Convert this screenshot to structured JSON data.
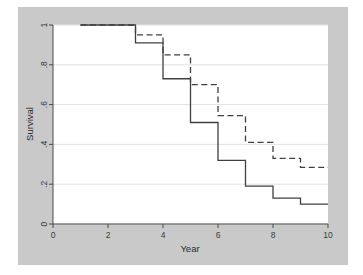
{
  "figure": {
    "panel_bg": "#c9c9c9",
    "plot_bg": "#ffffff",
    "grid_color": "#e2e2e2",
    "axis_color": "#4a4a4a"
  },
  "chart_data": {
    "type": "line",
    "title": "",
    "xlabel": "Year",
    "ylabel": "Survival",
    "xlim": [
      0,
      10
    ],
    "ylim": [
      0,
      1
    ],
    "xticks": [
      0,
      2,
      4,
      6,
      8,
      10
    ],
    "xtick_labels": [
      "0",
      "2",
      "4",
      "6",
      "8",
      "10"
    ],
    "yticks": [
      0,
      0.2,
      0.4,
      0.6,
      0.8,
      1
    ],
    "ytick_labels": [
      "0",
      ".2",
      ".4",
      ".6",
      ".8",
      "1"
    ],
    "grid": "horizontal",
    "legend": "none",
    "step_type": "post",
    "series": [
      {
        "name": "solid-curve",
        "style": "solid",
        "color": "#404040",
        "x": [
          1,
          2,
          3,
          4,
          5,
          6,
          7,
          8,
          9,
          10
        ],
        "values": [
          1.0,
          1.0,
          0.91,
          0.73,
          0.51,
          0.32,
          0.19,
          0.13,
          0.1,
          0.1
        ]
      },
      {
        "name": "dashed-curve",
        "style": "dashed",
        "color": "#404040",
        "x": [
          1,
          2,
          3,
          4,
          5,
          6,
          7,
          8,
          9,
          10
        ],
        "values": [
          1.0,
          1.0,
          0.95,
          0.85,
          0.7,
          0.545,
          0.41,
          0.33,
          0.285,
          0.285
        ]
      }
    ]
  }
}
